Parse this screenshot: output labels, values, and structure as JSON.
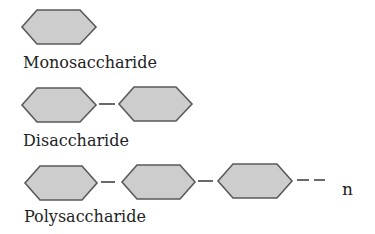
{
  "diagram": {
    "rows": [
      {
        "label": "Monosaccharide",
        "units": 1,
        "continues": false
      },
      {
        "label": "Disaccharide",
        "units": 2,
        "continues": false
      },
      {
        "label": "Polysaccharide",
        "units": 3,
        "continues": true,
        "repeat_symbol": "n"
      }
    ],
    "colors": {
      "hex_fill": "#cdcdcd",
      "hex_stroke": "#5a5a5a",
      "text": "#222222"
    }
  }
}
